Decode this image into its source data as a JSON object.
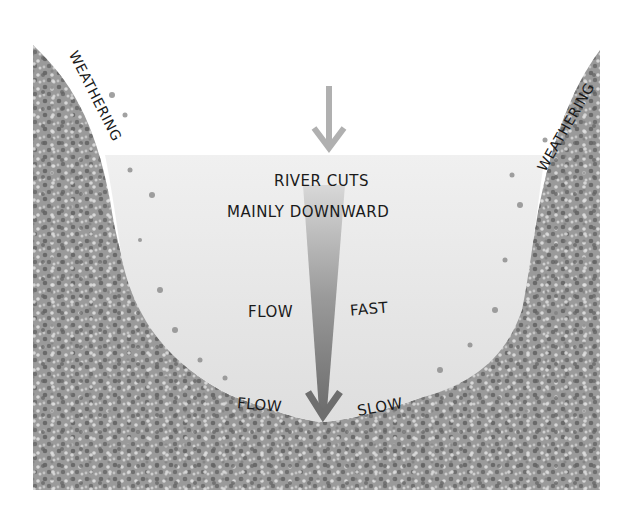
{
  "diagram": {
    "title_lines": [
      "RIVER CUTS",
      "MAINLY DOWNWARD"
    ],
    "labels": {
      "weathering_left": "WEATHERING",
      "weathering_right": "WEATHERING",
      "flow_fast_left": "FLOW",
      "flow_fast_right": "FAST",
      "flow_slow_left": "FLOW",
      "flow_slow_right": "SLOW"
    },
    "colors": {
      "background": "#ffffff",
      "rock": "#9a9a9a",
      "rock_dark_speckle": "#6e6e6e",
      "rock_light_speckle": "#d6d6d6",
      "water": "#e6e6e6",
      "arrow_top": "#b0b0b0",
      "velocity_arrow": "#7a7a7a",
      "text": "#1a1a1a"
    },
    "icons": {
      "incoming_arrow": "down-arrow-icon",
      "velocity_arrow": "tapered-down-arrow-icon"
    }
  }
}
